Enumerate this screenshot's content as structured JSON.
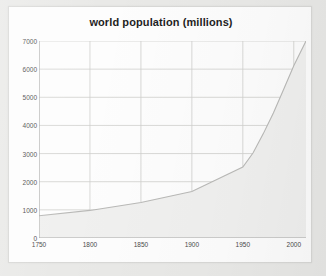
{
  "chart_data": {
    "type": "area",
    "title": "world population (millions)",
    "xlabel": "",
    "ylabel": "",
    "x": [
      1750,
      1800,
      1850,
      1900,
      1950,
      1960,
      1970,
      1980,
      1990,
      2000,
      2012
    ],
    "values": [
      790,
      980,
      1260,
      1650,
      2520,
      3020,
      3700,
      4440,
      5280,
      6120,
      7000
    ],
    "xlim": [
      1750,
      2012
    ],
    "ylim": [
      0,
      7000
    ],
    "xticks": [
      1750,
      1800,
      1850,
      1900,
      1950,
      2000
    ],
    "xtick_labels": [
      "1750",
      "1800",
      "1850",
      "1900",
      "1950",
      "2000"
    ],
    "yticks": [
      0,
      1000,
      2000,
      3000,
      4000,
      5000,
      6000,
      7000
    ],
    "ytick_labels": [
      "0",
      "1000",
      "2000",
      "3000",
      "4000",
      "5000",
      "6000",
      "7000"
    ],
    "grid": true,
    "legend": false,
    "series_name": "world population",
    "colors": {
      "area_fill": "#f0f0ef",
      "line": "#b9b9b7",
      "grid": "#cfcfcd",
      "axis": "#a8a8a6",
      "title_text": "#1f1f1f",
      "tick_text": "#4a4a4a",
      "card_background": "#fdfdfd",
      "page_background": "#e9e9e7"
    }
  }
}
